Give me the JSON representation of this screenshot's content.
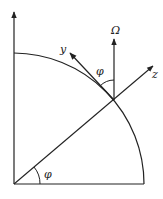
{
  "diagram": {
    "title": "",
    "labels": {
      "omega": "Ω",
      "y_axis": "y",
      "z_axis": "z",
      "phi_top": "φ",
      "phi_bottom": "φ"
    },
    "colors": {
      "stroke": "#222222",
      "background": "#ffffff"
    }
  }
}
